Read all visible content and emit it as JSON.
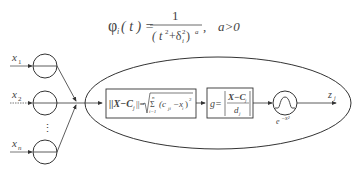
{
  "formula": {
    "lhs": "φ",
    "lhs_sub": "i",
    "lhs_arg": "( t ) =",
    "numerator": "1",
    "denominator_open": "( t",
    "denominator_sup_t": "2",
    "denominator_plus": "+δ",
    "denominator_sub_delta": "i",
    "denominator_sup_delta": "2",
    "denominator_close": " )",
    "denominator_exp": "a",
    "comma": ",",
    "condition": "a>0"
  },
  "inputs": [
    {
      "label": "x",
      "sub": "1"
    },
    {
      "label": "x",
      "sub": "2"
    },
    {
      "label": "x",
      "sub": "n"
    }
  ],
  "ellipsis": "⋮",
  "box1": {
    "norm": "||X−C",
    "norm_sub": "j",
    "norm_close": "||=",
    "sum_top": "n",
    "sum_bottom": "i=1",
    "sum_symbol": "Σ",
    "term": "(c",
    "term_sub": "ji",
    "term_minus": "−x",
    "term_sub2": "i",
    "term_close": ")",
    "term_sup": "2"
  },
  "box2": {
    "g": "g=",
    "num": "X−C",
    "num_sub": "j",
    "den": "d",
    "den_sub": "j"
  },
  "activation": {
    "label": "e",
    "label_sup": "−x²"
  },
  "output": {
    "label": "z",
    "sub": "j"
  }
}
